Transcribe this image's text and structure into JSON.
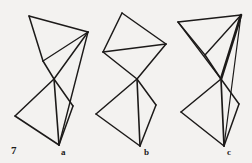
{
  "figure": {
    "plate_number": "7",
    "background_color": "#f3f2f0",
    "stroke_color": "#1c1a19",
    "width": 252,
    "height": 163,
    "caption_labels": [
      {
        "id": "a",
        "text": "a"
      },
      {
        "id": "b",
        "text": "b"
      },
      {
        "id": "c",
        "text": "c"
      }
    ],
    "panels": [
      {
        "id": "a",
        "label": "a",
        "description": "bowtie polyhedron net, upper triangle-fan over lower kite",
        "vertices": {
          "top_left": [
            29,
            16
          ],
          "top_right": [
            88,
            32
          ],
          "mid_left": [
            43,
            61
          ],
          "waist": [
            54,
            79
          ],
          "lower_left": [
            15,
            116
          ],
          "lower_right": [
            73,
            106
          ],
          "bottom": [
            59,
            145
          ]
        },
        "edges": [
          {
            "from": "top_left",
            "to": "top_right",
            "weight": 1.5
          },
          {
            "from": "top_left",
            "to": "mid_left",
            "weight": 1.5
          },
          {
            "from": "mid_left",
            "to": "top_right",
            "weight": 1.3
          },
          {
            "from": "mid_left",
            "to": "waist",
            "weight": 1.5
          },
          {
            "from": "waist",
            "to": "top_right",
            "weight": 1.5
          },
          {
            "from": "waist",
            "to": "lower_left",
            "weight": 1.5
          },
          {
            "from": "lower_left",
            "to": "bottom",
            "weight": 1.5
          },
          {
            "from": "bottom",
            "to": "lower_right",
            "weight": 1.5
          },
          {
            "from": "lower_right",
            "to": "waist",
            "weight": 1.5
          },
          {
            "from": "waist",
            "to": "bottom",
            "weight": 1.6
          },
          {
            "from": "top_right",
            "to": "bottom",
            "weight": 1.4
          }
        ]
      },
      {
        "id": "b",
        "label": "b",
        "description": "bowtie polyhedron net, upper quadrilateral with chord over lower kite",
        "vertices": {
          "top_apex": [
            122,
            13
          ],
          "top_right": [
            166,
            44
          ],
          "mid_left": [
            103,
            52
          ],
          "waist": [
            137,
            79
          ],
          "lower_left": [
            96,
            114
          ],
          "lower_right": [
            156,
            105
          ],
          "bottom": [
            140,
            146
          ]
        },
        "edges": [
          {
            "from": "top_apex",
            "to": "top_right",
            "weight": 1.5
          },
          {
            "from": "top_apex",
            "to": "mid_left",
            "weight": 1.5
          },
          {
            "from": "mid_left",
            "to": "top_right",
            "weight": 1.4
          },
          {
            "from": "mid_left",
            "to": "waist",
            "weight": 1.5
          },
          {
            "from": "waist",
            "to": "top_right",
            "weight": 1.5
          },
          {
            "from": "waist",
            "to": "lower_left",
            "weight": 1.5
          },
          {
            "from": "lower_left",
            "to": "bottom",
            "weight": 1.5
          },
          {
            "from": "bottom",
            "to": "lower_right",
            "weight": 1.5
          },
          {
            "from": "lower_right",
            "to": "waist",
            "weight": 1.5
          },
          {
            "from": "waist",
            "to": "bottom",
            "weight": 1.6
          }
        ]
      },
      {
        "id": "c",
        "label": "c",
        "description": "bowtie polyhedron net, upper triangle-fan with heavy right edge over lower kite",
        "vertices": {
          "top_left": [
            178,
            22
          ],
          "top_right": [
            241,
            15
          ],
          "mid_left": [
            205,
            55
          ],
          "waist": [
            221,
            79
          ],
          "lower_left": [
            181,
            112
          ],
          "lower_right": [
            239,
            104
          ],
          "bottom": [
            224,
            146
          ]
        },
        "edges": [
          {
            "from": "top_left",
            "to": "top_right",
            "weight": 1.5
          },
          {
            "from": "top_left",
            "to": "mid_left",
            "weight": 1.3
          },
          {
            "from": "mid_left",
            "to": "top_right",
            "weight": 1.4
          },
          {
            "from": "top_left",
            "to": "waist",
            "weight": 1.3
          },
          {
            "from": "mid_left",
            "to": "waist",
            "weight": 1.5
          },
          {
            "from": "top_right",
            "to": "waist",
            "weight": 2.6
          },
          {
            "from": "waist",
            "to": "lower_left",
            "weight": 1.5
          },
          {
            "from": "lower_left",
            "to": "bottom",
            "weight": 1.5
          },
          {
            "from": "bottom",
            "to": "lower_right",
            "weight": 1.5
          },
          {
            "from": "lower_right",
            "to": "waist",
            "weight": 1.5
          },
          {
            "from": "waist",
            "to": "bottom",
            "weight": 1.7
          },
          {
            "from": "top_right",
            "to": "bottom",
            "weight": 1.2
          }
        ]
      }
    ]
  }
}
